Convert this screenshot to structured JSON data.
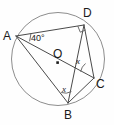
{
  "figure": {
    "kind": "circle-geometry-diagram",
    "background_color": "#ffffff",
    "line_color": "#4a4a4a",
    "circle_color": "#8d8d8d",
    "label_color": "#1a1a1a"
  },
  "points": {
    "A": {
      "label": "A",
      "x": 14,
      "y": 35
    },
    "D": {
      "label": "D",
      "x": 84,
      "y": 24
    },
    "C": {
      "label": "C",
      "x": 95,
      "y": 79
    },
    "B": {
      "label": "B",
      "x": 68,
      "y": 104
    },
    "O": {
      "label": "O",
      "x": 58,
      "y": 58
    }
  },
  "point_labels": {
    "A": "A",
    "D": "D",
    "C": "C",
    "B": "B",
    "O": "O"
  },
  "angles": {
    "at_A": "40°",
    "at_C": "x",
    "at_B": "x",
    "at_D": "right-angle"
  },
  "chords": [
    "A-D",
    "A-C",
    "A-B",
    "D-B",
    "D-C",
    "B-C"
  ]
}
